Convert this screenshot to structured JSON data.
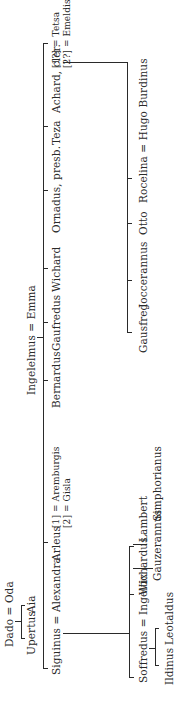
{
  "diagram": {
    "type": "genealogical-tree",
    "orientation": "rotated-90-ccw",
    "generation_0": {
      "couple": {
        "husband": "Dado",
        "wife": "Oda",
        "marriage_sign": "="
      },
      "children": [
        "Upertus",
        "Aia"
      ]
    },
    "generation_1": {
      "couple": {
        "husband": "Ingelelmus",
        "wife": "Emma",
        "marriage_sign": "="
      },
      "children": [
        {
          "name": "Siguinus",
          "spouse": "Alexandra"
        },
        {
          "name": "Arleus",
          "spouses": [
            {
              "order": "[1]",
              "name": "Aremburgis"
            },
            {
              "order": "[2]",
              "name": "Gisla"
            }
          ]
        },
        {
          "name": "Bernardus"
        },
        {
          "name": "Gaufredus"
        },
        {
          "name": "Wichard"
        },
        {
          "name": "Ornadus, presb."
        },
        {
          "name": "Teza"
        },
        {
          "name": "Achard, cler.",
          "spouses": [
            {
              "order": "[1?]",
              "name": "Tetsa"
            },
            {
              "order": "[2?]",
              "name": "Emeldis"
            }
          ]
        }
      ]
    },
    "generation_2_siguinus": {
      "children": [
        {
          "name": "Soffredus",
          "spouse": "Ingeltix"
        },
        {
          "name": "Wichardus"
        },
        {
          "name": "Lambert"
        }
      ]
    },
    "generation_3_soffredus": {
      "children": [
        "Ildinus",
        "Leotaldus"
      ]
    },
    "generation_3_wichardus": {
      "children": [
        "Gauzerannus",
        "Simphorianus"
      ]
    },
    "generation_2_achard": {
      "children": [
        {
          "name": "Gausfred"
        },
        {
          "name": "Joccerannus"
        },
        {
          "name": "Otto"
        },
        {
          "name": "Rocelina",
          "spouse": "Hugo Burdinus"
        }
      ]
    },
    "labels": {
      "dado_oda": "Dado = Oda",
      "upertus": "Upertus",
      "aia": "Aia",
      "ingelelmus_emma": "Ingelelmus = Emma",
      "siguinus_alexandra": "Siguinus = Alexandra",
      "arleus": "Arleus",
      "arleus_w1": "[1] = Aremburgis",
      "arleus_w2": "[2] = Gisla",
      "bernardus": "Bernardus",
      "gaufredus": "Gaufredus",
      "wichard": "Wichard",
      "ornadus": "Ornadus, presb.",
      "teza": "Teza",
      "achard": "Achard, cler.",
      "achard_w1": "[1?] = Tetsa",
      "achard_w2": "[2?] = Emeldis",
      "soffredus_ingeltix": "Soffredus = Ingeltix",
      "wichardus": "Wichardus",
      "lambert": "Lambert",
      "ildinus": "Ildinus",
      "leotaldus": "Leotaldus",
      "gauzerannus": "Gauzerannus",
      "simphorianus": "Simphorianus",
      "gausfred": "Gausfred",
      "joccerannus": "Joccerannus",
      "otto": "Otto",
      "rocelina_hugo": "Rocelina = Hugo Burdinus"
    }
  }
}
